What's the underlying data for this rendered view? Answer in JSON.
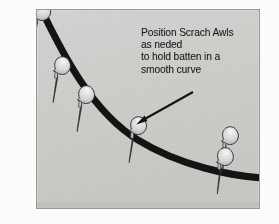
{
  "figure": {
    "kind": "technical-illustration",
    "background_color": "#ffffff",
    "panel": {
      "fill_color": "#cfcfcf",
      "border_color": "#9a9a9a",
      "x": 36,
      "y": 9,
      "width": 224,
      "height": 200
    },
    "batten": {
      "label": "batten",
      "color": "#141414",
      "stroke_width": 7,
      "path": "M 44 15 C 62 52, 92 112, 138 140 C 180 166, 232 176, 262 178"
    },
    "annotation": {
      "color": "#1b1b1b",
      "lines": [
        "Position Scrach Awls",
        "as neded",
        "to hold batten in a",
        "smooth curve"
      ],
      "full_text": "Position Scrach Awls as neded to hold batten in a smooth curve"
    },
    "arrow": {
      "color": "#141414",
      "from_x": 193,
      "from_y": 92,
      "to_x": 137,
      "to_y": 124,
      "points_to": "awl-4"
    },
    "awls": [
      {
        "id": "awl-1",
        "name": "scratch-awl-top-left-outer",
        "handle_x": 26,
        "handle_y": 16,
        "angle_deg": 53,
        "scale": 1.0
      },
      {
        "id": "awl-2",
        "name": "scratch-awl-top-left-inner",
        "handle_x": 42,
        "handle_y": 14,
        "angle_deg": 58,
        "scale": 1.0
      },
      {
        "id": "awl-3",
        "name": "scratch-awl-upper-slope",
        "handle_x": 63,
        "handle_y": 69,
        "angle_deg": 56,
        "scale": 1.0
      },
      {
        "id": "awl-4",
        "name": "scratch-awl-mid-slope",
        "handle_x": 87,
        "handle_y": 98,
        "angle_deg": 56,
        "scale": 1.0
      },
      {
        "id": "awl-5",
        "name": "scratch-awl-center",
        "handle_x": 139,
        "handle_y": 129,
        "angle_deg": 56,
        "scale": 1.0
      },
      {
        "id": "awl-6",
        "name": "scratch-awl-right-upper",
        "handle_x": 230,
        "handle_y": 138,
        "angle_deg": 54,
        "scale": 1.0
      },
      {
        "id": "awl-7",
        "name": "scratch-awl-right-lower",
        "handle_x": 226,
        "handle_y": 159,
        "angle_deg": 54,
        "scale": 1.0
      }
    ],
    "awl_style": {
      "handle_fill": "#d9d9d9",
      "handle_highlight": "#f1f1f1",
      "handle_shadow": "#9c9c9c",
      "outline": "#2a2a2a",
      "spike_color": "#3a3a3a"
    }
  }
}
